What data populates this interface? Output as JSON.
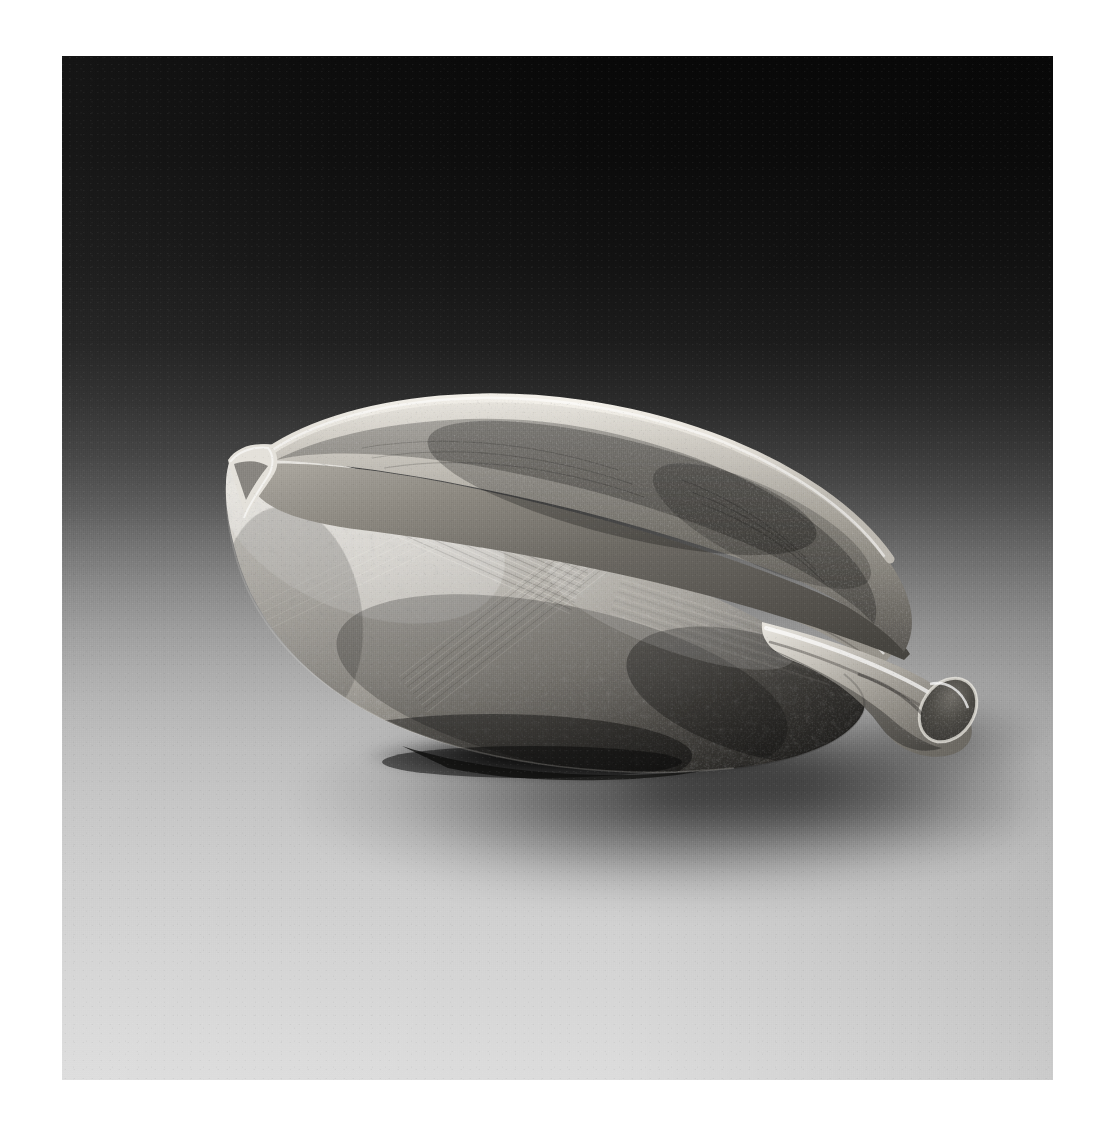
{
  "page": {
    "type": "photograph-plate",
    "background_color": "#ffffff",
    "plate": {
      "x": 62,
      "y": 56,
      "width": 991,
      "height": 1024
    }
  },
  "photo": {
    "medium": "black-and-white photograph",
    "palette": {
      "backdrop_top": "#080808",
      "backdrop_mid": "#6e6e6e",
      "backdrop_bottom": "#dcdcdc",
      "clay_light": "#d8d5cf",
      "clay_mid": "#9e9b94",
      "clay_dark": "#5a5853",
      "clay_shadow": "#2e2d2b",
      "cast_shadow": "#000000",
      "rim_highlight": "#efece6"
    },
    "lighting": {
      "key_light_direction": "upper-left",
      "backdrop_gradient": "dark top to light bottom",
      "cast_shadow_direction": "lower-right"
    }
  },
  "subject": {
    "name": "spouted leaf-shaped bowl",
    "form": "boat / leaf shaped vessel with pointed left tip and tubular pouring spout at right",
    "material": "unglazed stoneware with natural ash deposits",
    "surface": "pitted and pocked clay body with incised crosshatch combing on the outer wall",
    "orientation": "three-quarter view, spout to the right",
    "parts": [
      {
        "id": "rim-back",
        "label": "raised back rim"
      },
      {
        "id": "tip-left",
        "label": "pointed left tip"
      },
      {
        "id": "body",
        "label": "bowl body"
      },
      {
        "id": "interior",
        "label": "interior well"
      },
      {
        "id": "spout",
        "label": "pouring spout"
      },
      {
        "id": "spout-tip",
        "label": "spout opening"
      },
      {
        "id": "foot",
        "label": "foot / contact point"
      }
    ],
    "bounds_in_plate": {
      "x": 145,
      "y": 340,
      "width": 760,
      "height": 370
    }
  }
}
